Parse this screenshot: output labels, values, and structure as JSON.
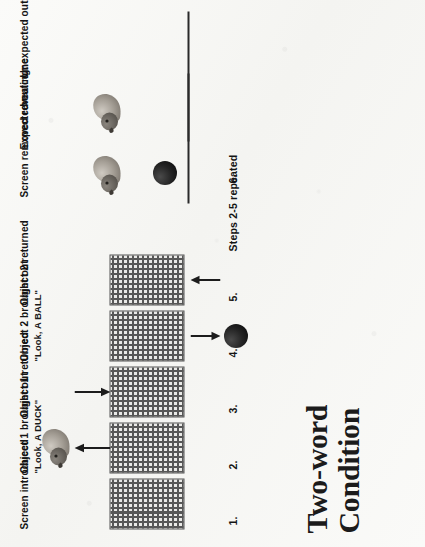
{
  "figure": {
    "title_line1": "Two-word",
    "title_line2": "Condition",
    "steps": [
      {
        "num": "1.",
        "label": "Screen introduced",
        "quote": ""
      },
      {
        "num": "2.",
        "label": "Object 1 brought out",
        "quote": "\"Look, A DUCK\""
      },
      {
        "num": "3.",
        "label": "Object 1 returned",
        "quote": ""
      },
      {
        "num": "4.",
        "label": "Object 2 brought out",
        "quote": "\"Look,  A BALL\""
      },
      {
        "num": "5.",
        "label": "Object 2 returned",
        "quote": ""
      },
      {
        "num": "6.",
        "label": "Screen removed revealing:",
        "quote": ""
      }
    ],
    "repeat_note": "Steps 2-5 repeated",
    "outcomes": {
      "expected": "Expected outcome",
      "separator": "or",
      "unexpected": "Unexpected outcome"
    },
    "icons": {
      "screen": "hatched-screen-icon",
      "duck": "duck-icon",
      "ball": "ball-icon",
      "arrow_out": "arrow-up-icon",
      "arrow_in": "arrow-down-icon",
      "stage": "stage-line-icon"
    },
    "colors": {
      "ink": "#141414",
      "screen_hatch": "#4a4a4a",
      "ball": "#1f1f1f",
      "duck_body": "#9a948c",
      "paper": "#f7f7f5"
    }
  }
}
